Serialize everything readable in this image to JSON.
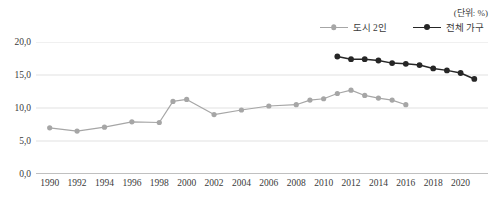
{
  "unit_note": "(단위: %)",
  "legend": {
    "position": "top-right",
    "items": [
      {
        "label": "도시 2인",
        "color": "#a6a6a6",
        "marker": "circle"
      },
      {
        "label": "전체 가구",
        "color": "#262626",
        "marker": "circle"
      }
    ]
  },
  "colors": {
    "series_city2": "#a6a6a6",
    "series_total": "#262626",
    "gridline": "#d9d9d9",
    "axis": "#808080",
    "text": "#3a3a3a",
    "background": "#ffffff"
  },
  "chart_data": {
    "type": "line",
    "title": "",
    "subtitle": "",
    "xlabel": "",
    "ylabel": "",
    "unit": "%",
    "grid": true,
    "legend_position": "top-right",
    "xlim": [
      1989,
      2022
    ],
    "ylim": [
      0.0,
      20.0
    ],
    "ytick_labels": [
      "0,0",
      "5,0",
      "10,0",
      "15,0",
      "20,0"
    ],
    "yticks": [
      0.0,
      5.0,
      10.0,
      15.0,
      20.0
    ],
    "xtick_labels": [
      "1990",
      "1992",
      "1994",
      "1996",
      "1998",
      "2000",
      "2002",
      "2004",
      "2006",
      "2008",
      "2010",
      "2012",
      "2014",
      "2016",
      "2018",
      "2020"
    ],
    "xticks": [
      1990,
      1992,
      1994,
      1996,
      1998,
      2000,
      2002,
      2004,
      2006,
      2008,
      2010,
      2012,
      2014,
      2016,
      2018,
      2020
    ],
    "series": [
      {
        "name": "도시 2인",
        "color": "#a6a6a6",
        "x": [
          1990,
          1992,
          1994,
          1996,
          1998,
          1999,
          2000,
          2002,
          2004,
          2006,
          2008,
          2009,
          2010,
          2011,
          2012,
          2013,
          2014,
          2015,
          2016
        ],
        "values": [
          7.0,
          6.5,
          7.1,
          7.9,
          7.8,
          11.0,
          11.3,
          9.0,
          9.7,
          10.3,
          10.5,
          11.2,
          11.4,
          12.2,
          12.7,
          11.9,
          11.5,
          11.2,
          10.5
        ]
      },
      {
        "name": "전체 가구",
        "color": "#262626",
        "x": [
          2011,
          2012,
          2013,
          2014,
          2015,
          2016,
          2017,
          2018,
          2019,
          2020,
          2021
        ],
        "values": [
          17.8,
          17.4,
          17.4,
          17.2,
          16.8,
          16.7,
          16.5,
          16.0,
          15.7,
          15.3,
          14.4
        ]
      }
    ]
  }
}
